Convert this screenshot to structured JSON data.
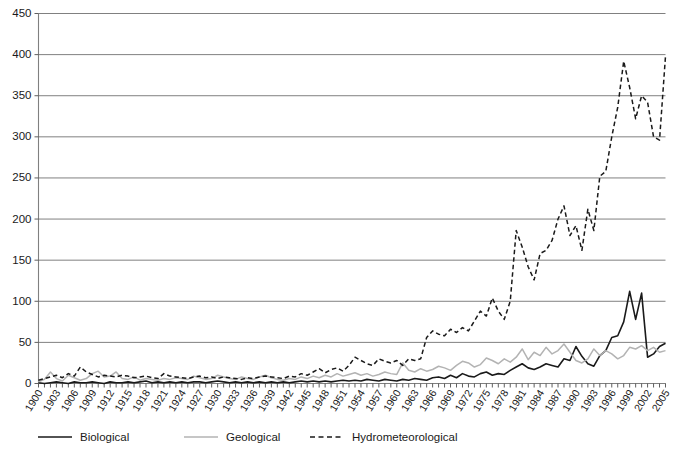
{
  "chart_data": {
    "type": "line",
    "title": "",
    "subtitle": "",
    "xlabel": "",
    "ylabel": "",
    "xlim": [
      1900,
      2005
    ],
    "ylim": [
      0,
      450
    ],
    "ytick_step": 50,
    "yticks": [
      0,
      50,
      100,
      150,
      200,
      250,
      300,
      350,
      400,
      450
    ],
    "xtick_step": 3,
    "grid": true,
    "legend_position": "bottom-left",
    "x": [
      1900,
      1901,
      1902,
      1903,
      1904,
      1905,
      1906,
      1907,
      1908,
      1909,
      1910,
      1911,
      1912,
      1913,
      1914,
      1915,
      1916,
      1917,
      1918,
      1919,
      1920,
      1921,
      1922,
      1923,
      1924,
      1925,
      1926,
      1927,
      1928,
      1929,
      1930,
      1931,
      1932,
      1933,
      1934,
      1935,
      1936,
      1937,
      1938,
      1939,
      1940,
      1941,
      1942,
      1943,
      1944,
      1945,
      1946,
      1947,
      1948,
      1949,
      1950,
      1951,
      1952,
      1953,
      1954,
      1955,
      1956,
      1957,
      1958,
      1959,
      1960,
      1961,
      1962,
      1963,
      1964,
      1965,
      1966,
      1967,
      1968,
      1969,
      1970,
      1971,
      1972,
      1973,
      1974,
      1975,
      1976,
      1977,
      1978,
      1979,
      1980,
      1981,
      1982,
      1983,
      1984,
      1985,
      1986,
      1987,
      1988,
      1989,
      1990,
      1991,
      1992,
      1993,
      1994,
      1995,
      1996,
      1997,
      1998,
      1999,
      2000,
      2001,
      2002,
      2003,
      2004,
      2005
    ],
    "xtick_labels": [
      "1900",
      "1903",
      "1906",
      "1909",
      "1912",
      "1915",
      "1918",
      "1921",
      "1924",
      "1927",
      "1930",
      "1933",
      "1936",
      "1939",
      "1942",
      "1945",
      "1948",
      "1951",
      "1954",
      "1957",
      "1960",
      "1963",
      "1966",
      "1969",
      "1972",
      "1975",
      "1978",
      "1981",
      "1984",
      "1987",
      "1990",
      "1993",
      "1996",
      "1999",
      "2002",
      "2005"
    ],
    "series": [
      {
        "name": "Biological",
        "color": "#1a1a1a",
        "style": "solid",
        "width": 1.6,
        "values": [
          1,
          0,
          1,
          2,
          1,
          0,
          2,
          1,
          1,
          2,
          1,
          0,
          2,
          1,
          1,
          2,
          1,
          2,
          3,
          1,
          2,
          1,
          2,
          1,
          2,
          1,
          2,
          2,
          1,
          2,
          3,
          2,
          1,
          2,
          1,
          2,
          1,
          2,
          1,
          2,
          1,
          2,
          1,
          2,
          3,
          2,
          3,
          2,
          3,
          2,
          3,
          4,
          3,
          4,
          3,
          5,
          4,
          3,
          5,
          4,
          3,
          5,
          4,
          6,
          5,
          4,
          7,
          8,
          6,
          10,
          7,
          12,
          9,
          8,
          12,
          14,
          10,
          12,
          11,
          16,
          20,
          24,
          19,
          17,
          20,
          24,
          22,
          20,
          30,
          28,
          45,
          33,
          24,
          21,
          34,
          40,
          56,
          58,
          75,
          112,
          78,
          110,
          32,
          36,
          45,
          49
        ]
      },
      {
        "name": "Geological",
        "color": "#b3b3b3",
        "style": "solid",
        "width": 1.5,
        "values": [
          2,
          5,
          14,
          6,
          3,
          10,
          7,
          4,
          6,
          12,
          15,
          8,
          9,
          14,
          6,
          5,
          8,
          4,
          6,
          5,
          4,
          6,
          5,
          7,
          6,
          5,
          9,
          7,
          5,
          6,
          10,
          8,
          6,
          5,
          8,
          6,
          5,
          8,
          10,
          7,
          5,
          4,
          6,
          5,
          8,
          6,
          9,
          7,
          10,
          8,
          12,
          9,
          11,
          13,
          10,
          12,
          9,
          11,
          14,
          12,
          11,
          25,
          16,
          14,
          18,
          15,
          17,
          21,
          19,
          16,
          22,
          27,
          25,
          20,
          23,
          31,
          28,
          24,
          30,
          26,
          32,
          42,
          29,
          38,
          34,
          44,
          36,
          40,
          48,
          38,
          28,
          25,
          30,
          42,
          34,
          40,
          36,
          30,
          34,
          44,
          42,
          46,
          40,
          44,
          38,
          40
        ]
      },
      {
        "name": "Hydrometeorological",
        "color": "#1a1a1a",
        "style": "dashed",
        "width": 1.5,
        "values": [
          4,
          6,
          8,
          10,
          7,
          12,
          9,
          20,
          14,
          11,
          8,
          10,
          9,
          8,
          10,
          9,
          7,
          8,
          9,
          7,
          6,
          12,
          9,
          8,
          7,
          6,
          8,
          9,
          7,
          8,
          6,
          8,
          7,
          6,
          5,
          7,
          6,
          8,
          9,
          8,
          7,
          6,
          9,
          8,
          12,
          10,
          14,
          18,
          13,
          17,
          19,
          15,
          22,
          32,
          28,
          24,
          22,
          30,
          27,
          25,
          28,
          22,
          30,
          28,
          30,
          56,
          64,
          60,
          58,
          66,
          62,
          68,
          64,
          76,
          88,
          82,
          104,
          88,
          78,
          100,
          186,
          166,
          142,
          126,
          158,
          162,
          174,
          200,
          216,
          180,
          192,
          162,
          212,
          186,
          252,
          258,
          300,
          336,
          392,
          360,
          322,
          350,
          342,
          300,
          296,
          398
        ]
      }
    ],
    "legend": [
      {
        "label": "Biological",
        "color": "#1a1a1a",
        "style": "solid"
      },
      {
        "label": "Geological",
        "color": "#b3b3b3",
        "style": "solid"
      },
      {
        "label": "Hydrometeorological",
        "color": "#1a1a1a",
        "style": "dashed"
      }
    ]
  }
}
